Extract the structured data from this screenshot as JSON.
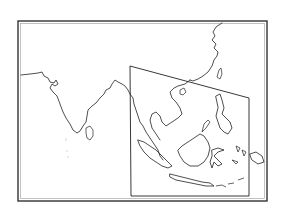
{
  "map": {
    "type": "outline-map",
    "region": "South and Southeast Asia",
    "labels": [],
    "colors": {
      "background": "#ffffff",
      "frame": "#333333",
      "coastline": "#222222",
      "inset_box": "#222222"
    },
    "frame": {
      "x": 18,
      "y": 21,
      "width": 249,
      "height": 180
    },
    "inset_box": {
      "points": [
        [
          130,
          66
        ],
        [
          249,
          98
        ],
        [
          249,
          196
        ],
        [
          131,
          196
        ]
      ]
    }
  }
}
